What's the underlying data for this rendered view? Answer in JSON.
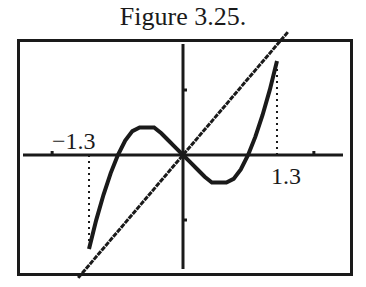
{
  "title": "Figure 3.25.",
  "chart_data": {
    "type": "line",
    "title": "Figure 3.25.",
    "xlabel": "",
    "ylabel": "",
    "annotations": [
      "-1.3",
      "1.3"
    ],
    "xlim": [
      -2.3,
      2.3
    ],
    "ylim": [
      -1.6,
      1.6
    ],
    "grid": false,
    "legend": null,
    "series": [
      {
        "name": "cubic curve",
        "style": "stepped solid",
        "x": [
          -1.3,
          -1.2,
          -1.1,
          -1.0,
          -0.9,
          -0.8,
          -0.7,
          -0.6,
          -0.5,
          -0.4,
          -0.3,
          -0.2,
          -0.1,
          0,
          0.1,
          0.2,
          0.3,
          0.4,
          0.5,
          0.6,
          0.7,
          0.8,
          0.9,
          1.0,
          1.1,
          1.2,
          1.3
        ],
        "y": [
          -1.3,
          -0.9,
          -0.55,
          -0.25,
          0.0,
          0.2,
          0.33,
          0.38,
          0.38,
          0.38,
          0.3,
          0.2,
          0.1,
          0,
          -0.1,
          -0.2,
          -0.3,
          -0.38,
          -0.38,
          -0.38,
          -0.33,
          -0.2,
          0.0,
          0.25,
          0.55,
          0.9,
          1.3
        ]
      },
      {
        "name": "line y = x",
        "style": "stepped solid",
        "x": [
          -1.45,
          1.45
        ],
        "y": [
          -1.7,
          1.7
        ]
      }
    ],
    "reference_lines": [
      {
        "type": "vertical",
        "x": -1.3,
        "style": "dotted",
        "from_y": 0,
        "to_y": -1.3
      },
      {
        "type": "vertical",
        "x": 1.3,
        "style": "dotted",
        "from_y": 0,
        "to_y": 1.3
      }
    ],
    "ticks": {
      "x": [
        -2,
        2
      ],
      "y": [
        -1,
        1
      ]
    },
    "tick_labels": [
      {
        "text": "-1.3",
        "x": -1.3
      },
      {
        "text": "1.3",
        "x": 1.3
      }
    ]
  },
  "labels": {
    "neg": "−1.3",
    "pos": "1.3"
  }
}
